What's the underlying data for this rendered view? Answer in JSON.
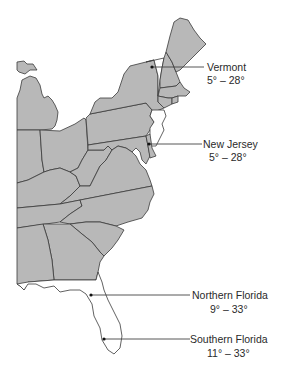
{
  "map": {
    "region": "Eastern United States",
    "colors": {
      "state_fill": "#b8b8b8",
      "highlight_fill": "#ffffff",
      "border": "#3a3a3a",
      "text": "#2a2a2a"
    },
    "highlighted_states": [
      "Vermont",
      "New Jersey",
      "Florida"
    ]
  },
  "callouts": [
    {
      "label": "Vermont",
      "range": "5° – 28°"
    },
    {
      "label": "New Jersey",
      "range": "5° – 28°"
    },
    {
      "label": "Northern Florida",
      "range": "9° – 33°"
    },
    {
      "label": "Southern Florida",
      "range": "11° – 33°"
    }
  ]
}
